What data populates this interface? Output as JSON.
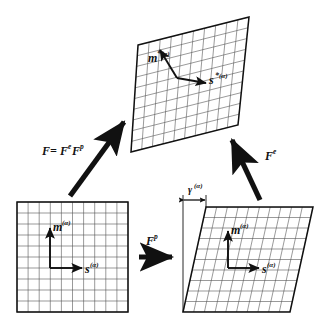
{
  "figure": {
    "type": "diagram",
    "background_color": "#ffffff",
    "line_color": "#111111",
    "grid_color": "#555555"
  },
  "configurations": [
    {
      "id": "reference",
      "name": "reference-configuration",
      "shape": "square",
      "position": "bottom-left",
      "grid_rows": 10,
      "grid_cols": 10,
      "vectors": [
        {
          "name": "slip-normal-vector",
          "base": "m",
          "superscript": "(α)",
          "direction": "up"
        },
        {
          "name": "slip-direction-vector",
          "base": "s",
          "superscript": "(α)",
          "direction": "right"
        }
      ]
    },
    {
      "id": "intermediate",
      "name": "intermediate-configuration",
      "shape": "sheared-parallelogram",
      "position": "bottom-right",
      "grid_rows": 10,
      "grid_cols": 10,
      "vectors": [
        {
          "name": "slip-normal-vector",
          "base": "m",
          "superscript": "(α)",
          "direction": "up"
        },
        {
          "name": "slip-direction-vector",
          "base": "s",
          "superscript": "(α)",
          "direction": "right"
        }
      ],
      "shear_measure": {
        "name": "shear-strain",
        "base": "γ",
        "superscript": "(α)"
      }
    },
    {
      "id": "current",
      "name": "current-configuration",
      "shape": "rotated-sheared-quadrilateral",
      "position": "top",
      "grid_rows": 10,
      "grid_cols": 10,
      "vectors": [
        {
          "name": "slip-normal-vector-current",
          "base": "m",
          "star": "*",
          "superscript": "(α)",
          "direction": "up-left"
        },
        {
          "name": "slip-direction-vector-current",
          "base": "s",
          "star": "*",
          "superscript": "(α)",
          "direction": "right"
        }
      ]
    }
  ],
  "arrows": [
    {
      "name": "total-deformation-arrow",
      "from": "reference",
      "to": "current",
      "label_parts": {
        "lhs": "F",
        "equals": "=",
        "first": "F",
        "first_sup": "e",
        "second": "F",
        "second_sup": "p"
      },
      "label_text": "F = FᵉFᵖ"
    },
    {
      "name": "plastic-deformation-arrow",
      "from": "reference",
      "to": "intermediate",
      "label_parts": {
        "base": "F",
        "superscript": "p"
      },
      "label_text": "Fᵖ"
    },
    {
      "name": "elastic-deformation-arrow",
      "from": "intermediate",
      "to": "current",
      "label_parts": {
        "base": "F",
        "superscript": "e"
      },
      "label_text": "Fᵉ"
    }
  ],
  "labels": {
    "F": "F",
    "equals": "=",
    "sup_e": "e",
    "sup_p": "p",
    "m": "m",
    "s": "s",
    "gamma": "γ",
    "star": "*",
    "alpha_sup": "(α)"
  }
}
